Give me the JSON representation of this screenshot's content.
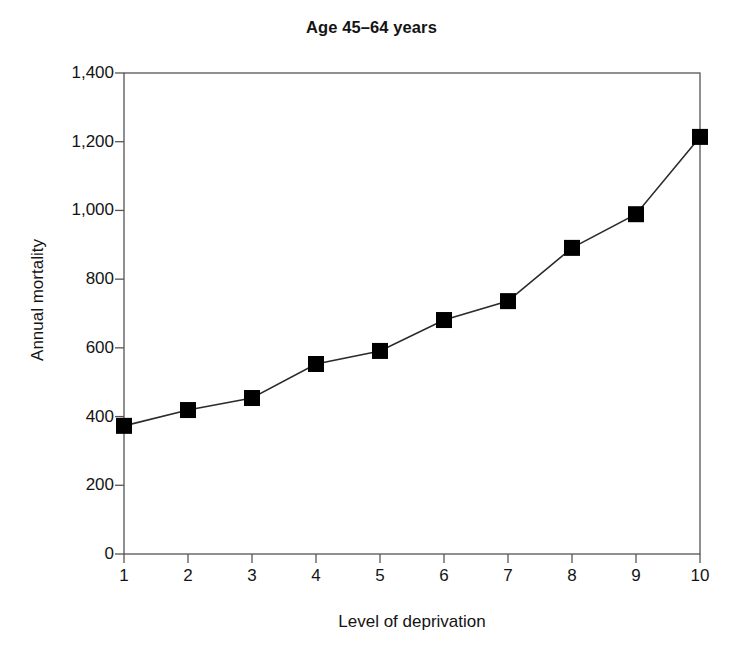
{
  "chart_data": {
    "type": "line",
    "title": "Age 45–64 years",
    "xlabel": "Level of deprivation",
    "ylabel": "Annual mortality",
    "x": [
      1,
      2,
      3,
      4,
      5,
      6,
      7,
      8,
      9,
      10
    ],
    "categories": [
      "1",
      "2",
      "3",
      "4",
      "5",
      "6",
      "7",
      "8",
      "9",
      "10"
    ],
    "values": [
      373,
      419,
      454,
      553,
      591,
      681,
      736,
      891,
      989,
      1214
    ],
    "series": [
      {
        "name": "Age 45–64 years",
        "values": [
          373,
          419,
          454,
          553,
          591,
          681,
          736,
          891,
          989,
          1214
        ]
      }
    ],
    "xlim": [
      1,
      10
    ],
    "ylim": [
      0,
      1400
    ],
    "ytick_values": [
      0,
      200,
      400,
      600,
      800,
      1000,
      1200,
      1400
    ],
    "ytick_labels": [
      "0",
      "200",
      "400",
      "600",
      "800",
      "1,000",
      "1,200",
      "1,400"
    ],
    "xtick_values": [
      1,
      2,
      3,
      4,
      5,
      6,
      7,
      8,
      9,
      10
    ],
    "xtick_labels": [
      "1",
      "2",
      "3",
      "4",
      "5",
      "6",
      "7",
      "8",
      "9",
      "10"
    ],
    "grid": false,
    "legend": "none",
    "marker": "square",
    "marker_color": "#000000",
    "line_color": "#2b2b2b",
    "frame_color": "#555555",
    "background_color": "#ffffff"
  }
}
